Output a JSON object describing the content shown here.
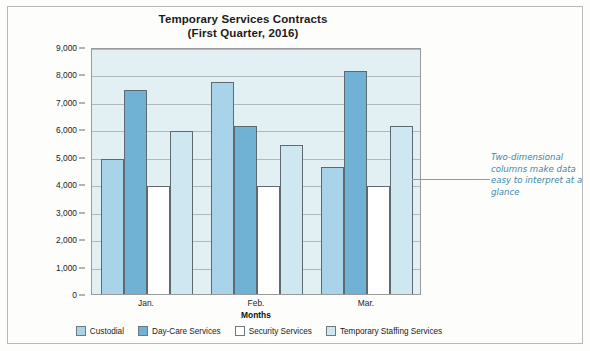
{
  "chart_data": {
    "type": "bar",
    "title": "Temporary Services Contracts",
    "subtitle": "(First Quarter, 2016)",
    "xlabel": "Months",
    "ylabel": "Dollars Spent",
    "categories": [
      "Jan.",
      "Feb.",
      "Mar."
    ],
    "ylim": [
      0,
      9000
    ],
    "yticks": [
      "0",
      "1,000",
      "2,000",
      "3,000",
      "4,000",
      "5,000",
      "6,000",
      "7,000",
      "8,000",
      "9,000"
    ],
    "ytick_values": [
      0,
      1000,
      2000,
      3000,
      4000,
      5000,
      6000,
      7000,
      8000,
      9000
    ],
    "grid": true,
    "legend_position": "bottom",
    "series": [
      {
        "name": "Custodial",
        "color": "#a9d3e8",
        "values": [
          5000,
          7800,
          4700
        ]
      },
      {
        "name": "Day-Care Services",
        "color": "#6fb2d4",
        "values": [
          7500,
          6200,
          8200
        ]
      },
      {
        "name": "Security Services",
        "color": "#ffffff",
        "values": [
          4000,
          4000,
          4000
        ]
      },
      {
        "name": "Temporary Staffing Services",
        "color": "#cfe7f0",
        "values": [
          6000,
          5500,
          6200
        ]
      }
    ],
    "annotation": "Two-dimensional columns make data easy to interpret at a glance",
    "plot_background": "#e2f0f4",
    "annotation_color": "#3f87a8"
  }
}
